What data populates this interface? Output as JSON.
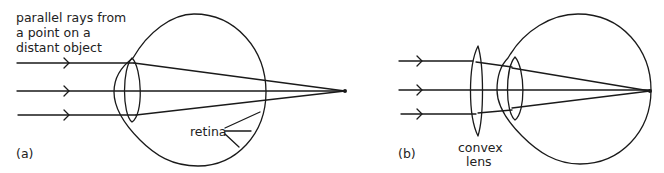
{
  "panel_a": {
    "tag": "(a)",
    "caption_lines": [
      "parallel rays from",
      "a point on a",
      "distant object"
    ],
    "retina_label": "retina"
  },
  "panel_b": {
    "tag": "(b)",
    "lens_label_lines": [
      "convex",
      "lens"
    ]
  },
  "colors": {
    "stroke": "#1a1a1a",
    "text": "#222222",
    "background": "#ffffff"
  }
}
